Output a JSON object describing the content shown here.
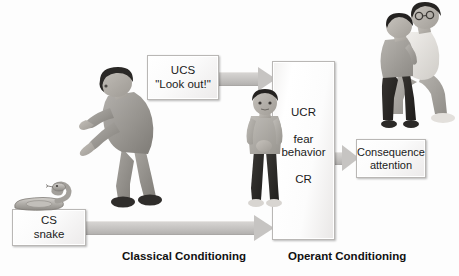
{
  "diagram": {
    "background_color": "#fdfdfd",
    "boxes": {
      "ucs": {
        "line1": "UCS",
        "line2": "\"Look out!\""
      },
      "cs": {
        "line1": "CS",
        "line2": "snake"
      },
      "center": {
        "line1": "UCR",
        "line2": "fear",
        "line3": "behavior",
        "line4": "CR"
      },
      "consequence": {
        "line1": "Consequence",
        "line2": "attention"
      }
    },
    "captions": {
      "classical": "Classical Conditioning",
      "operant": "Operant Conditioning"
    },
    "arrows": [
      {
        "name": "ucs-to-center",
        "from": "ucs",
        "to": "center",
        "color": "#c6c4c2"
      },
      {
        "name": "cs-to-center",
        "from": "cs",
        "to": "center",
        "color": "#c6c4c2"
      },
      {
        "name": "center-to-consequence",
        "from": "center",
        "to": "consequence",
        "color": "#c6c4c2"
      }
    ],
    "illustrations": [
      {
        "name": "pointing-man",
        "description": "man bent forward pointing downward"
      },
      {
        "name": "frightened-child",
        "description": "child standing with hands clasped"
      },
      {
        "name": "adult-comforting-child",
        "description": "adult kneeling embracing a child"
      },
      {
        "name": "snake",
        "description": "coiled snake with raised head"
      }
    ],
    "colors": {
      "box_border": "#b9b7b5",
      "arrow_fill": "#c6c4c2",
      "text": "#1b1b1b",
      "figure_gray": "#9a9793"
    }
  }
}
